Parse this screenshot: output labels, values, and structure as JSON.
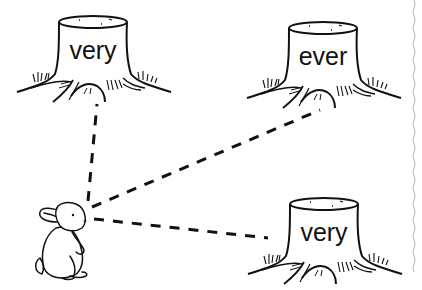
{
  "worksheet": {
    "stumps": [
      {
        "id": "top-left",
        "word": "very"
      },
      {
        "id": "top-right",
        "word": "ever"
      },
      {
        "id": "bottom-right",
        "word": "very"
      }
    ],
    "character": "rabbit",
    "paths": [
      {
        "from": "rabbit",
        "to": "top-left",
        "style": "dashed"
      },
      {
        "from": "rabbit",
        "to": "top-right",
        "style": "dashed"
      },
      {
        "from": "rabbit",
        "to": "bottom-right",
        "style": "dashed"
      }
    ],
    "colors": {
      "ink": "#111111",
      "background": "#ffffff",
      "edge": "#b5b5b5"
    }
  }
}
